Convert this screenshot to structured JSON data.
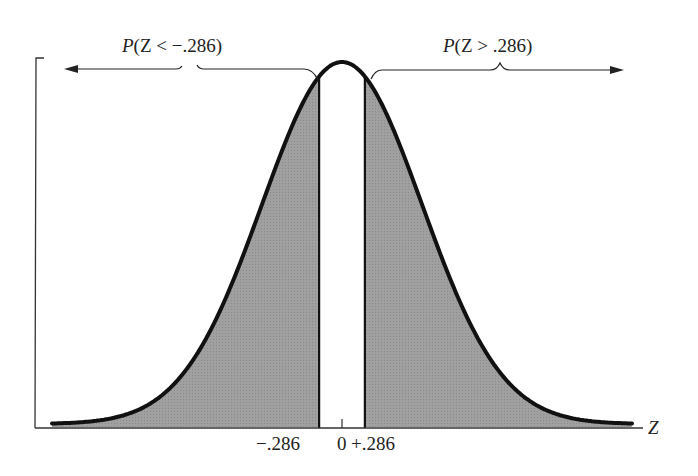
{
  "figure": {
    "left_label_prefix": "P",
    "left_label_body": "(Z < −.286)",
    "right_label_prefix": "P",
    "right_label_body": "(Z > .286)",
    "axis_label": "Z",
    "tick_labels": [
      "−.286",
      "0",
      "+.286"
    ],
    "colors": {
      "shade": "#9a9a9a",
      "curve": "#111111",
      "axis": "#333333",
      "background": "#ffffff"
    }
  },
  "chart_data": {
    "type": "area",
    "title": "",
    "xlabel": "Z",
    "ylabel": "",
    "x_ticks": [
      -0.286,
      0,
      0.286
    ],
    "x_tick_labels": [
      "−.286",
      "0",
      "+.286"
    ],
    "shaded_regions": [
      {
        "label": "P(Z < −.286)",
        "from": "-inf",
        "to": -0.286
      },
      {
        "label": "P(Z > .286)",
        "from": 0.286,
        "to": "inf"
      }
    ],
    "unshaded_region": {
      "from": -0.286,
      "to": 0.286
    },
    "distribution": {
      "name": "standard normal",
      "mean": 0,
      "sd": 1
    }
  }
}
